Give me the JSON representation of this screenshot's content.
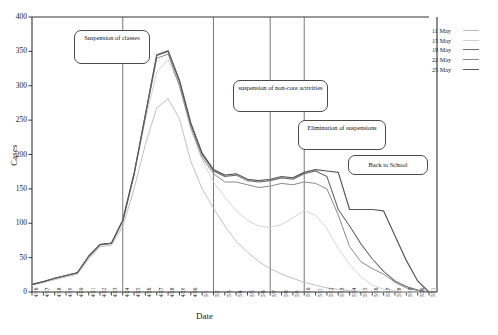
{
  "chart_data": {
    "type": "line",
    "title": "",
    "xlabel": "Date",
    "ylabel": "Cases",
    "ylim": [
      0,
      400
    ],
    "ytick_step": 50,
    "yticks": [
      "400",
      "350",
      "300",
      "250",
      "200",
      "150",
      "100",
      "50",
      "0"
    ],
    "grid": false,
    "legend_position": "top-right",
    "x": [
      "4/16",
      "4/17",
      "4/18",
      "4/19",
      "4/20",
      "4/21",
      "4/22",
      "4/23",
      "4/24",
      "4/25",
      "4/26",
      "4/27",
      "4/28",
      "4/29",
      "4/30",
      "5/1",
      "5/2",
      "5/3",
      "5/4",
      "5/5",
      "5/6",
      "5/7",
      "5/8",
      "5/9",
      "5/10",
      "5/11",
      "5/12",
      "5/13",
      "5/14",
      "5/15",
      "5/16",
      "5/17",
      "5/18",
      "5/19",
      "5/20",
      "5/21"
    ],
    "series": [
      {
        "name": "11 May",
        "color": "#b9b9b9",
        "width": 0.9,
        "values": [
          10,
          14,
          18,
          22,
          26,
          48,
          66,
          68,
          95,
          150,
          215,
          268,
          281,
          252,
          190,
          150,
          122,
          96,
          74,
          58,
          44,
          34,
          26,
          20,
          14,
          10,
          6,
          4,
          2,
          1,
          0,
          0,
          0,
          0,
          0,
          0
        ]
      },
      {
        "name": "15 May",
        "color": "#cfcfcf",
        "width": 0.9,
        "values": [
          10,
          14,
          19,
          23,
          27,
          50,
          68,
          70,
          100,
          168,
          250,
          320,
          338,
          300,
          236,
          192,
          160,
          138,
          118,
          104,
          96,
          94,
          98,
          108,
          118,
          112,
          92,
          64,
          40,
          22,
          10,
          4,
          2,
          0,
          0,
          0
        ]
      },
      {
        "name": "19 May",
        "color": "#6d6d6d",
        "width": 1.1,
        "values": [
          11,
          15,
          20,
          24,
          28,
          52,
          69,
          71,
          104,
          172,
          258,
          344,
          350,
          306,
          244,
          200,
          176,
          168,
          170,
          162,
          160,
          162,
          166,
          164,
          172,
          176,
          168,
          120,
          96,
          70,
          48,
          30,
          16,
          8,
          3,
          0
        ]
      },
      {
        "name": "22 May",
        "color": "#8a8a8a",
        "width": 1.0,
        "values": [
          11,
          15,
          20,
          24,
          28,
          52,
          69,
          71,
          104,
          172,
          256,
          340,
          346,
          300,
          240,
          196,
          172,
          160,
          160,
          156,
          152,
          154,
          158,
          156,
          160,
          158,
          150,
          112,
          66,
          44,
          34,
          26,
          14,
          6,
          2,
          0
        ]
      },
      {
        "name": "25 May",
        "color": "#595959",
        "width": 1.2,
        "values": [
          11,
          15,
          20,
          24,
          28,
          52,
          69,
          71,
          104,
          172,
          258,
          345,
          351,
          308,
          246,
          202,
          178,
          170,
          172,
          164,
          162,
          164,
          168,
          166,
          174,
          178,
          176,
          174,
          120,
          120,
          120,
          118,
          82,
          46,
          16,
          0
        ]
      }
    ],
    "event_lines": [
      {
        "name": "suspension-of-classes-line",
        "x": "4/24"
      },
      {
        "name": "suspension-of-non-core-activities-line",
        "x": "5/2"
      },
      {
        "name": "elimination-of-suspensions-line",
        "x": "5/7"
      },
      {
        "name": "back-to-school-line",
        "x": "5/10"
      }
    ],
    "annotations": [
      {
        "name": "suspension-of-classes",
        "text": "Suspension of classes"
      },
      {
        "name": "suspension-of-non-core-activities",
        "text": "suspension of non-core activities"
      },
      {
        "name": "elimination-of-suspensions",
        "text": "Elimination of suspensions"
      },
      {
        "name": "back-to-school",
        "text": "Back to School"
      }
    ]
  }
}
